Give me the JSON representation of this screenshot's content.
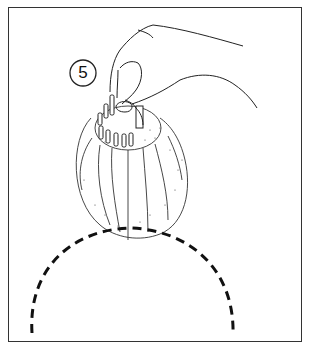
{
  "figure": {
    "step_number": "5",
    "colors": {
      "line": "#222222",
      "background": "#ffffff",
      "frame": "#333333"
    }
  }
}
